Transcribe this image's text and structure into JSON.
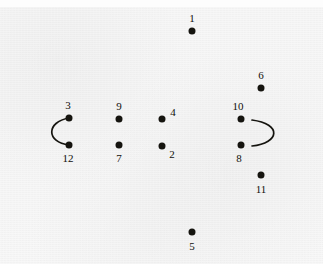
{
  "figure": {
    "type": "dot-and-arc-diagram",
    "width": 323,
    "height": 264,
    "background_color": "#f3f3f3",
    "dot_color": "#15140f",
    "arc_color": "#15140f",
    "label_color": "#100f0b"
  },
  "dots": [
    {
      "id": "1",
      "label": "1",
      "x": 192,
      "y": 31,
      "label_x": 192,
      "label_y": 18,
      "label_position": "above"
    },
    {
      "id": "6",
      "label": "6",
      "x": 261,
      "y": 88,
      "label_x": 261,
      "label_y": 75,
      "label_position": "above"
    },
    {
      "id": "3",
      "label": "3",
      "x": 69,
      "y": 118,
      "label_x": 68,
      "label_y": 105,
      "label_position": "above"
    },
    {
      "id": "9",
      "label": "9",
      "x": 119,
      "y": 119,
      "label_x": 119,
      "label_y": 106,
      "label_position": "above"
    },
    {
      "id": "4",
      "label": "4",
      "x": 162,
      "y": 119,
      "label_x": 173,
      "label_y": 112,
      "label_position": "upper-right"
    },
    {
      "id": "10",
      "label": "10",
      "x": 241,
      "y": 119,
      "label_x": 238,
      "label_y": 106,
      "label_position": "above"
    },
    {
      "id": "12",
      "label": "12",
      "x": 69,
      "y": 145,
      "label_x": 68,
      "label_y": 158,
      "label_position": "below"
    },
    {
      "id": "7",
      "label": "7",
      "x": 119,
      "y": 145,
      "label_x": 119,
      "label_y": 158,
      "label_position": "below"
    },
    {
      "id": "2",
      "label": "2",
      "x": 162,
      "y": 146,
      "label_x": 172,
      "label_y": 154,
      "label_position": "lower-right"
    },
    {
      "id": "8",
      "label": "8",
      "x": 241,
      "y": 145,
      "label_x": 239,
      "label_y": 158,
      "label_position": "below"
    },
    {
      "id": "11",
      "label": "11",
      "x": 261,
      "y": 175,
      "label_x": 261,
      "label_y": 189,
      "label_position": "below"
    },
    {
      "id": "5",
      "label": "5",
      "x": 192,
      "y": 232,
      "label_x": 192,
      "label_y": 246,
      "label_position": "below"
    }
  ],
  "arcs": [
    {
      "name": "left-arc",
      "shape": "c-open-right",
      "path": "M 69 118 C 46 122, 46 142, 69 145",
      "connects": [
        "3",
        "12"
      ],
      "attached_to_dots": true
    },
    {
      "name": "right-arc",
      "shape": "c-open-left",
      "path": "M 252 120 C 282 124, 280 143, 252 146",
      "connects": [],
      "attached_to_dots": false
    }
  ]
}
